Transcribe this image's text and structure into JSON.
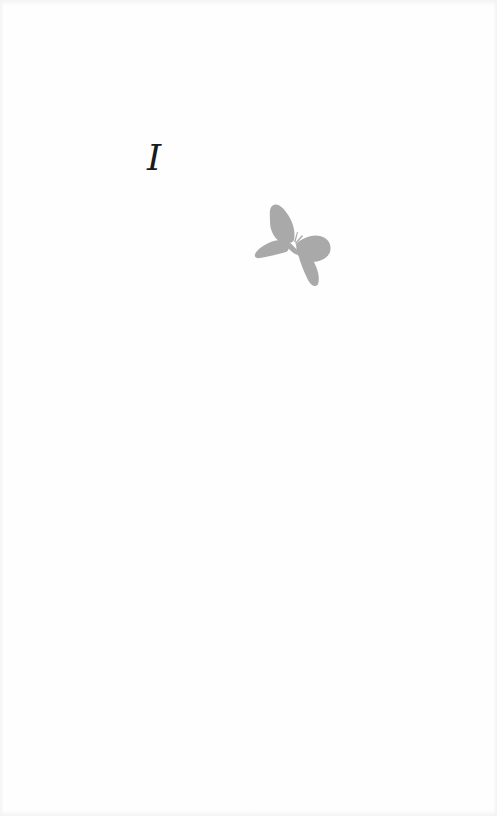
{
  "page": {
    "background_color": "#fefefe"
  },
  "chapter": {
    "numeral": "I",
    "color": "#1a1a1a"
  },
  "ornament": {
    "icon": "butterfly-icon",
    "color": "#a9a9a9"
  }
}
